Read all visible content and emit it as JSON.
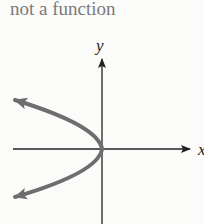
{
  "title": "not a function",
  "axes": {
    "x_label": "x",
    "y_label": "y"
  },
  "curve": {
    "description": "sideways parabola opening left, vertex at origin",
    "equation_hint": "x = -y^2",
    "color": "#6e6e6e",
    "arrows": [
      "upper-left",
      "lower-left"
    ]
  },
  "colors": {
    "background": "#fbfbf9",
    "axes": "#222222",
    "title": "#7a7a7a"
  }
}
